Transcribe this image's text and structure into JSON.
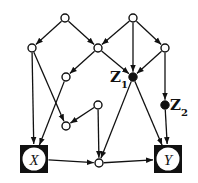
{
  "diagram": {
    "type": "causal-dag",
    "nodes": [
      {
        "id": "a",
        "kind": "open",
        "x": 65,
        "y": 18,
        "label": ""
      },
      {
        "id": "d",
        "kind": "open",
        "x": 133,
        "y": 18,
        "label": ""
      },
      {
        "id": "b",
        "kind": "open",
        "x": 32,
        "y": 48,
        "label": ""
      },
      {
        "id": "c",
        "kind": "open",
        "x": 98,
        "y": 48,
        "label": ""
      },
      {
        "id": "e",
        "kind": "open",
        "x": 165,
        "y": 48,
        "label": ""
      },
      {
        "id": "f",
        "kind": "open",
        "x": 66,
        "y": 77,
        "label": ""
      },
      {
        "id": "z1",
        "kind": "filled",
        "x": 133,
        "y": 77,
        "label": "Z",
        "subscript": "1"
      },
      {
        "id": "h",
        "kind": "open",
        "x": 98,
        "y": 105,
        "label": ""
      },
      {
        "id": "z2",
        "kind": "filled",
        "x": 165,
        "y": 105,
        "label": "Z",
        "subscript": "2"
      },
      {
        "id": "g",
        "kind": "open",
        "x": 66,
        "y": 126,
        "label": ""
      },
      {
        "id": "x",
        "kind": "boxed",
        "x": 34,
        "y": 159,
        "label": "X"
      },
      {
        "id": "m",
        "kind": "open",
        "x": 99,
        "y": 163,
        "label": ""
      },
      {
        "id": "y",
        "kind": "boxed",
        "x": 168,
        "y": 159,
        "label": "Y"
      }
    ],
    "edges": [
      [
        "a",
        "b"
      ],
      [
        "a",
        "c"
      ],
      [
        "d",
        "c"
      ],
      [
        "d",
        "z1"
      ],
      [
        "d",
        "e"
      ],
      [
        "c",
        "f"
      ],
      [
        "c",
        "z1"
      ],
      [
        "e",
        "z1"
      ],
      [
        "e",
        "z2"
      ],
      [
        "b",
        "x"
      ],
      [
        "b",
        "g"
      ],
      [
        "f",
        "x"
      ],
      [
        "h",
        "g"
      ],
      [
        "h",
        "m"
      ],
      [
        "z1",
        "m"
      ],
      [
        "z1",
        "y"
      ],
      [
        "z2",
        "y"
      ],
      [
        "x",
        "m"
      ],
      [
        "m",
        "y"
      ]
    ]
  },
  "labels": {
    "z1": "Z",
    "z1_sub": "1",
    "z2": "Z",
    "z2_sub": "2",
    "x": "X",
    "y": "Y"
  }
}
